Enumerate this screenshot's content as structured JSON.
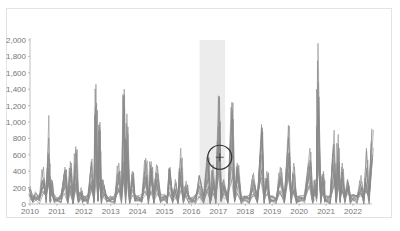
{
  "chart_data": {
    "type": "line",
    "title": "",
    "xlabel": "",
    "ylabel": "",
    "x_ticks": [
      "2010",
      "2011",
      "2012",
      "2013",
      "2014",
      "2015",
      "2016",
      "2017",
      "2018",
      "2019",
      "2020",
      "2021",
      "2022"
    ],
    "y_ticks": [
      "0",
      "200",
      "400",
      "600",
      "800",
      "1,000",
      "1,200",
      "1,400",
      "1,600",
      "1,800",
      "2,000"
    ],
    "ylim": [
      0,
      2000
    ],
    "xlim": [
      2010,
      2022.8
    ],
    "grid": false,
    "legend": "none",
    "highlight_band": {
      "from": 2016.3,
      "to": 2017.25,
      "color": "#ececec"
    },
    "annotation": {
      "type": "magnifier-crosshair",
      "x": 2017.05,
      "y": 570
    },
    "series_color": "#8a8a8a",
    "series_description": "Many overlapping grey time series (~15) with seasonal spikes",
    "series": [
      {
        "name": "peak-envelope",
        "x": [
          2010.0,
          2010.2,
          2010.5,
          2010.7,
          2010.8,
          2011.0,
          2011.3,
          2011.5,
          2011.7,
          2011.9,
          2012.0,
          2012.3,
          2012.45,
          2012.6,
          2012.7,
          2013.0,
          2013.3,
          2013.5,
          2013.6,
          2013.8,
          2014.0,
          2014.3,
          2014.5,
          2014.7,
          2015.0,
          2015.2,
          2015.4,
          2015.6,
          2015.8,
          2016.0,
          2016.3,
          2016.6,
          2016.8,
          2017.0,
          2017.2,
          2017.5,
          2017.7,
          2018.0,
          2018.3,
          2018.6,
          2018.8,
          2019.0,
          2019.3,
          2019.6,
          2019.8,
          2020.0,
          2020.4,
          2020.6,
          2020.7,
          2020.9,
          2021.0,
          2021.3,
          2021.45,
          2021.6,
          2021.8,
          2022.0,
          2022.3,
          2022.5,
          2022.7
        ],
        "values": [
          220,
          150,
          450,
          1080,
          300,
          80,
          450,
          520,
          700,
          200,
          100,
          550,
          1460,
          1000,
          300,
          100,
          500,
          1400,
          1100,
          400,
          100,
          560,
          520,
          480,
          120,
          450,
          300,
          680,
          280,
          80,
          350,
          600,
          480,
          1320,
          300,
          1240,
          500,
          100,
          380,
          970,
          400,
          100,
          450,
          960,
          500,
          100,
          680,
          300,
          1960,
          400,
          100,
          900,
          850,
          500,
          300,
          120,
          350,
          680,
          920
        ]
      }
    ]
  }
}
